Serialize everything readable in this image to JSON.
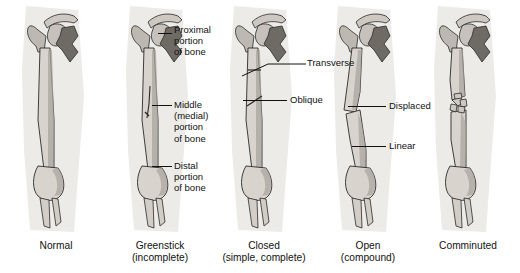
{
  "figure": {
    "panels": [
      {
        "id": "normal",
        "caption": "Normal",
        "sub": "",
        "icon": "bone-normal-icon"
      },
      {
        "id": "greenstick",
        "caption": "Greenstick",
        "sub": "(incomplete)",
        "icon": "bone-greenstick-icon"
      },
      {
        "id": "closed",
        "caption": "Closed",
        "sub": "(simple, complete)",
        "icon": "bone-closed-icon"
      },
      {
        "id": "open",
        "caption": "Open",
        "sub": "(compound)",
        "icon": "bone-open-icon"
      },
      {
        "id": "comminuted",
        "caption": "Comminuted",
        "sub": "",
        "icon": "bone-comminuted-icon"
      }
    ],
    "annotations": [
      {
        "id": "proximal",
        "text": "Proximal\nportion\nof bone"
      },
      {
        "id": "middle",
        "text": "Middle\n(medial)\nportion\nof bone"
      },
      {
        "id": "distal",
        "text": "Distal\nportion\nof bone"
      },
      {
        "id": "transverse",
        "text": "Transverse"
      },
      {
        "id": "oblique",
        "text": "Oblique"
      },
      {
        "id": "displaced",
        "text": "Displaced"
      },
      {
        "id": "linear",
        "text": "Linear"
      }
    ],
    "colors": {
      "background": "#ffffff",
      "text": "#111111",
      "bone_fill": "#d8d4cd",
      "bone_shade": "#a8a49d",
      "bone_dark": "#6e6a64",
      "soft_tissue": "#e9e7e3",
      "outline": "#2b2b2b"
    }
  }
}
